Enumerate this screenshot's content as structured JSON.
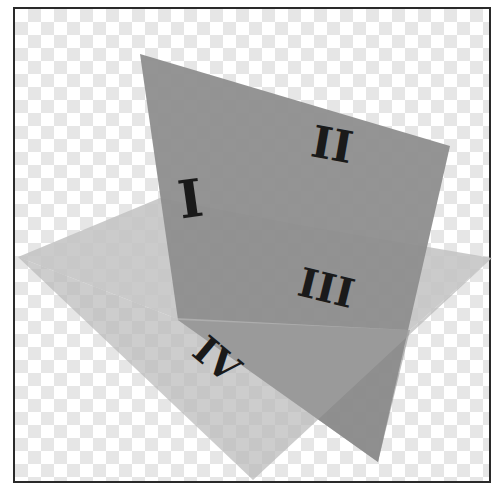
{
  "diagram": {
    "type": "intersecting-planes",
    "colors": {
      "background_checker_light": "#ffffff",
      "background_checker_dark": "#e6e6e6",
      "horizontal_plane": "#bdbdbd",
      "vertical_plane": "#8c8c8c",
      "frame_border": "#2a2a2a",
      "numeral": "#1a1a1a"
    },
    "labels": {
      "quadrant_1": "I",
      "quadrant_2": "II",
      "quadrant_3": "III",
      "quadrant_4": "IV"
    }
  }
}
